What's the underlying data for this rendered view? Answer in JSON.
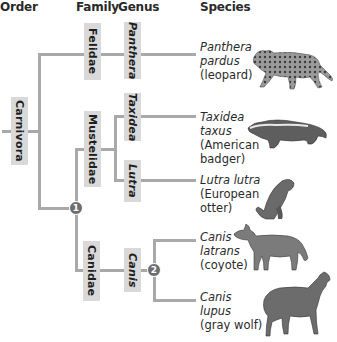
{
  "headers": {
    "order": "Order",
    "family": "Family",
    "genus": "Genus",
    "species": "Species"
  },
  "order": {
    "label": "Carnivora"
  },
  "families": [
    {
      "label": "Felidae"
    },
    {
      "label": "Mustelidae"
    },
    {
      "label": "Canidae"
    }
  ],
  "genera": [
    {
      "label": "Panthera"
    },
    {
      "label": "Taxidea"
    },
    {
      "label": "Lutra"
    },
    {
      "label": "Canis"
    }
  ],
  "species": [
    {
      "sci_line1": "Panthera",
      "sci_line2": "pardus",
      "common": "(leopard)",
      "image": "leopard-illustration"
    },
    {
      "sci_line1": "Taxidea",
      "sci_line2": "taxus",
      "common_line1": "(American",
      "common_line2": "badger)",
      "image": "badger-illustration"
    },
    {
      "sci_line1": "Lutra lutra",
      "common_line1": "(European",
      "common_line2": "otter)",
      "image": "otter-illustration"
    },
    {
      "sci_line1": "Canis",
      "sci_line2": "latrans",
      "common": "(coyote)",
      "image": "coyote-illustration"
    },
    {
      "sci_line1": "Canis",
      "sci_line2": "lupus",
      "common": "(gray wolf)",
      "image": "wolf-illustration"
    }
  ],
  "nodes": [
    {
      "label": "1"
    },
    {
      "label": "2"
    }
  ],
  "colors": {
    "branch": "#a9a9a9",
    "label_box": "#d9d9d9",
    "node": "#6d6d6d"
  }
}
